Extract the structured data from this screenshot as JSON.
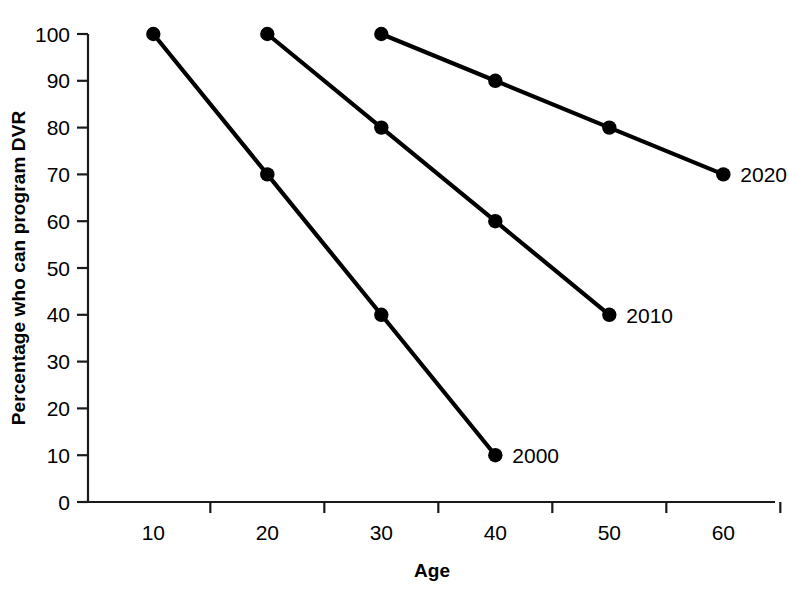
{
  "chart_data": {
    "type": "line",
    "title": "",
    "subtitle": "",
    "xlabel": "Age",
    "ylabel": "Percentage who can program DVR",
    "x": [
      10,
      20,
      30,
      40,
      50,
      60
    ],
    "xtick_labels": [
      "10",
      "20",
      "30",
      "40",
      "50",
      "60"
    ],
    "ytick_labels": [
      "0",
      "10",
      "20",
      "30",
      "40",
      "50",
      "60",
      "70",
      "80",
      "90",
      "100"
    ],
    "ytick_values": [
      0,
      10,
      20,
      30,
      40,
      50,
      60,
      70,
      80,
      90,
      100
    ],
    "xlim": [
      5,
      65
    ],
    "ylim": [
      0,
      100
    ],
    "grid": false,
    "legend_position": "inline-right-of-series",
    "marker": "filled-circle",
    "line_color": "#000000",
    "marker_color": "#000000",
    "background_color": "#ffffff",
    "series": [
      {
        "name": "2000",
        "label": "2000",
        "x": [
          10,
          20,
          30,
          40
        ],
        "values": [
          100,
          70,
          40,
          10
        ],
        "label_anchor": {
          "x": 40,
          "y": 10
        }
      },
      {
        "name": "2010",
        "label": "2010",
        "x": [
          20,
          30,
          40,
          50
        ],
        "values": [
          100,
          80,
          60,
          40
        ],
        "label_anchor": {
          "x": 50,
          "y": 40
        }
      },
      {
        "name": "2020",
        "label": "2020",
        "x": [
          30,
          40,
          50,
          60
        ],
        "values": [
          100,
          90,
          80,
          70
        ],
        "label_anchor": {
          "x": 60,
          "y": 70
        }
      }
    ]
  }
}
